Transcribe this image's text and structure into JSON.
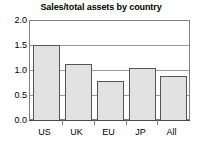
{
  "chart_data": {
    "type": "bar",
    "title": "Sales/total assets by country",
    "xlabel": "",
    "ylabel": "",
    "categories": [
      "US",
      "UK",
      "EU",
      "JP",
      "All"
    ],
    "values": [
      1.5,
      1.12,
      0.78,
      1.04,
      0.88
    ],
    "ylim": [
      0.0,
      2.0
    ],
    "yticks": [
      "0.0",
      "0.5",
      "1.0",
      "1.5",
      "2.0"
    ],
    "ytick_values": [
      0.0,
      0.5,
      1.0,
      1.5,
      2.0
    ],
    "grid": true,
    "legend": false,
    "legend_position": "none",
    "bar_fill_color": "#e2e2e2",
    "bar_border_color": "#555555",
    "gridline_color": "#9a9a9a",
    "axis_color": "#4a4a4a",
    "background_color": "#ffffff",
    "text_color": "#000000"
  }
}
